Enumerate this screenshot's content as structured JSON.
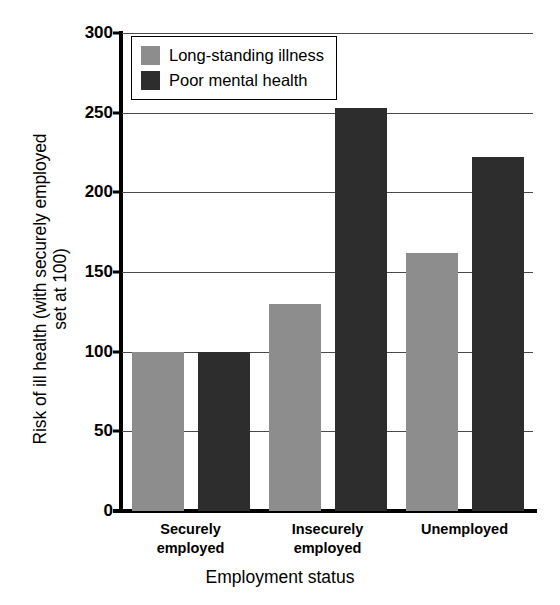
{
  "chart_data": {
    "type": "bar",
    "title": "",
    "xlabel": "Employment status",
    "ylabel_line1": "Risk of ill health (with securely employed",
    "ylabel_line2": "set at 100)",
    "categories": [
      "Securely employed",
      "Insecurely employed",
      "Unemployed"
    ],
    "category_lines": [
      [
        "Securely",
        "employed"
      ],
      [
        "Insecurely",
        "employed"
      ],
      [
        "Unemployed",
        ""
      ]
    ],
    "series": [
      {
        "name": "Long-standing illness",
        "color": "#8d8d8d",
        "values": [
          100,
          130,
          162
        ]
      },
      {
        "name": "Poor mental health",
        "color": "#2d2d2d",
        "values": [
          100,
          253,
          222
        ]
      }
    ],
    "ylim": [
      0,
      300
    ],
    "yticks": [
      0,
      50,
      100,
      150,
      200,
      250,
      300
    ],
    "ytick_labels": [
      "0",
      "50",
      "100",
      "150",
      "200",
      "250",
      "300"
    ],
    "grid": true,
    "legend_position": "top-left"
  },
  "legend": {
    "items": [
      {
        "label": "Long-standing illness",
        "swatch": "light-gray-swatch"
      },
      {
        "label": "Poor mental health",
        "swatch": "dark-swatch"
      }
    ]
  },
  "colors": {
    "light_gray": "#8d8d8d",
    "dark": "#2d2d2d",
    "axis": "#000000",
    "grid": "#4a4a4a",
    "background": "#ffffff"
  }
}
